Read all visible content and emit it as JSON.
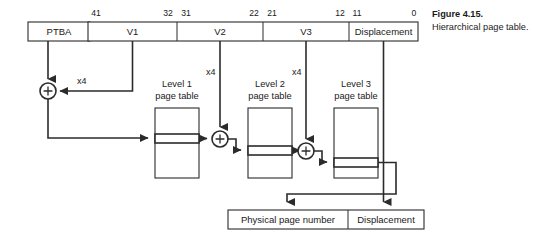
{
  "figure": {
    "caption_title": "Figure 4.15.",
    "caption_text": "Hierarchical page table."
  },
  "ptba": {
    "label": "PTBA"
  },
  "virtual_address": {
    "fields": [
      {
        "name": "V1",
        "label": "V1",
        "bit_high": "41",
        "bit_low": "32"
      },
      {
        "name": "V2",
        "label": "V2",
        "bit_high": "31",
        "bit_low": "22"
      },
      {
        "name": "V3",
        "label": "V3",
        "bit_high": "21",
        "bit_low": "12"
      },
      {
        "name": "Displacement",
        "label": "Displacement",
        "bit_high": "11",
        "bit_low": "0"
      }
    ]
  },
  "adders": [
    {
      "symbol": "+",
      "scale_label": "x4"
    },
    {
      "symbol": "+",
      "scale_label": "x4"
    },
    {
      "symbol": "+",
      "scale_label": "x4"
    }
  ],
  "page_tables": [
    {
      "line1": "Level 1",
      "line2": "page table"
    },
    {
      "line1": "Level 2",
      "line2": "page table"
    },
    {
      "line1": "Level 3",
      "line2": "page table"
    }
  ],
  "physical_address": {
    "page_number_label": "Physical page number",
    "displacement_label": "Displacement"
  },
  "colors": {
    "stroke": "#2b2b2b",
    "background": "#ffffff",
    "text": "#1a1a1a"
  }
}
